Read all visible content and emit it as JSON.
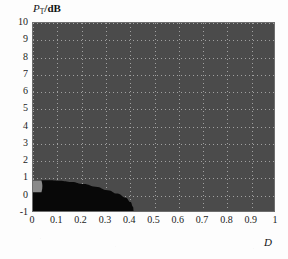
{
  "figure": {
    "background_color": "#fdfdfd",
    "panel_color": "#4b4b4b",
    "grid_color": "#bebebe",
    "region_color": "#080808",
    "notch_color": "#8a8a8a"
  },
  "chart_data": {
    "type": "heatmap",
    "title": "",
    "subtitle": "",
    "xlabel": "D",
    "ylabel": "P_T/dB",
    "ylabel_base": "P",
    "ylabel_sub": "T",
    "ylabel_unit": "/dB",
    "xlim": [
      0,
      1
    ],
    "ylim": [
      -1,
      10
    ],
    "grid": true,
    "grid_style": "dotted",
    "legend": "none",
    "xticks": [
      0,
      0.1,
      0.2,
      0.3,
      0.4,
      0.5,
      0.6,
      0.7,
      0.8,
      0.9,
      1
    ],
    "xtick_labels": [
      "0",
      "0.1",
      "0.2",
      "0.3",
      "0.4",
      "0.5",
      "0.6",
      "0.7",
      "0.8",
      "0.9",
      "1"
    ],
    "yticks": [
      10,
      9,
      8,
      7,
      6,
      5,
      4,
      3,
      2,
      1,
      0,
      -1
    ],
    "ytick_labels": [
      "10",
      "9",
      "8",
      "7",
      "6",
      "5",
      "4",
      "3",
      "2",
      "1",
      "0",
      "-1"
    ],
    "series": [
      {
        "name": "dark region",
        "fill": "#080808",
        "description": "lens / bullet shaped dark area in lower-left of panel",
        "x_extent": [
          0.0,
          0.42
        ],
        "y_extent": [
          -1.0,
          0.78
        ],
        "boundary_upper": [
          {
            "x": 0.0,
            "y": 0.78
          },
          {
            "x": 0.02,
            "y": 0.78
          },
          {
            "x": 0.04,
            "y": 0.8
          },
          {
            "x": 0.07,
            "y": 0.8
          },
          {
            "x": 0.11,
            "y": 0.77
          },
          {
            "x": 0.16,
            "y": 0.7
          },
          {
            "x": 0.21,
            "y": 0.58
          },
          {
            "x": 0.26,
            "y": 0.42
          },
          {
            "x": 0.31,
            "y": 0.22
          },
          {
            "x": 0.35,
            "y": 0.02
          },
          {
            "x": 0.385,
            "y": -0.22
          },
          {
            "x": 0.405,
            "y": -0.48
          },
          {
            "x": 0.415,
            "y": -0.75
          },
          {
            "x": 0.418,
            "y": -1.0
          }
        ],
        "boundary_lower": [
          {
            "x": 0.0,
            "y": -1.0
          },
          {
            "x": 0.418,
            "y": -1.0
          }
        ]
      },
      {
        "name": "notch",
        "fill": "#8a8a8a",
        "description": "small light-gray notch at upper-left corner of the dark region",
        "x_extent": [
          0.0,
          0.035
        ],
        "y_extent": [
          0.1,
          0.78
        ]
      }
    ]
  }
}
